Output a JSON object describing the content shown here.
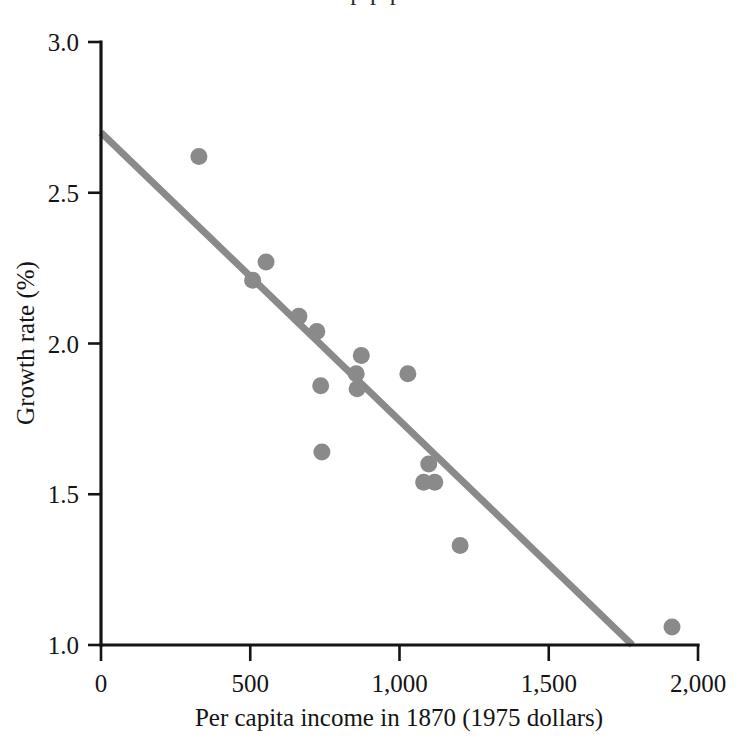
{
  "figure": {
    "background_color": "#ffffff",
    "point_color": "#8a8a8a",
    "line_color": "#8a8a8a",
    "axis_color": "#141414",
    "cropped_top_text": "p p p"
  },
  "chart_data": {
    "type": "scatter",
    "title": "",
    "subtitle": "",
    "xlabel": "Per capita income in 1870 (1975 dollars)",
    "ylabel": "Growth rate (%)",
    "xlim": [
      0,
      2000
    ],
    "ylim": [
      1.0,
      3.0
    ],
    "xticks": [
      0,
      500,
      1000,
      1500,
      2000
    ],
    "xtick_labels": [
      "0",
      "500",
      "1,000",
      "1,500",
      "2,000"
    ],
    "yticks": [
      1.0,
      1.5,
      2.0,
      2.5,
      3.0
    ],
    "ytick_labels": [
      "1.0",
      "1.5",
      "2.0",
      "2.5",
      "3.0"
    ],
    "grid": false,
    "legend": null,
    "legend_position": "none",
    "annotations": [],
    "series": [
      {
        "name": "Countries",
        "marker": "circle",
        "color": "#8a8a8a",
        "points": [
          {
            "x": 328,
            "y": 2.62
          },
          {
            "x": 508,
            "y": 2.21
          },
          {
            "x": 553,
            "y": 2.27
          },
          {
            "x": 663,
            "y": 2.09
          },
          {
            "x": 723,
            "y": 2.04
          },
          {
            "x": 736,
            "y": 1.86
          },
          {
            "x": 740,
            "y": 1.64
          },
          {
            "x": 855,
            "y": 1.9
          },
          {
            "x": 858,
            "y": 1.85
          },
          {
            "x": 872,
            "y": 1.96
          },
          {
            "x": 1028,
            "y": 1.9
          },
          {
            "x": 1081,
            "y": 1.54
          },
          {
            "x": 1098,
            "y": 1.6
          },
          {
            "x": 1118,
            "y": 1.54
          },
          {
            "x": 1203,
            "y": 1.33
          },
          {
            "x": 1913,
            "y": 1.06
          }
        ]
      }
    ],
    "fit_line": {
      "name": "Regression line",
      "color": "#8a8a8a",
      "x_start": 0,
      "y_start": 2.7,
      "x_end": 1780,
      "y_end": 1.0,
      "slope_per_1000": -0.955,
      "intercept": 2.7
    }
  }
}
